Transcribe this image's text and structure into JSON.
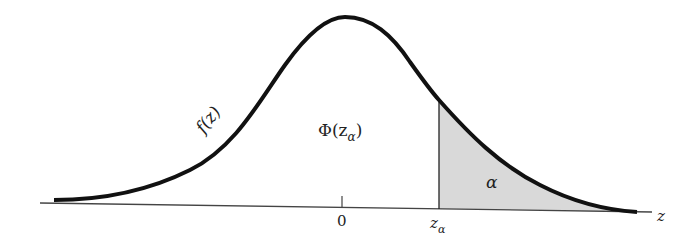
{
  "diagram": {
    "type": "normal-distribution-upper-tail",
    "curve_label": "f(z)",
    "cdf_label": "Φ(z",
    "cdf_label_sub": "α",
    "cdf_label_close": ")",
    "tail_label": "α",
    "axis_label": "z",
    "tick_zero_label": "0",
    "critical_label": "z",
    "critical_label_sub": "α",
    "colors": {
      "curve": "#111111",
      "axis": "#444444",
      "shade": "#d9d9d9"
    }
  }
}
